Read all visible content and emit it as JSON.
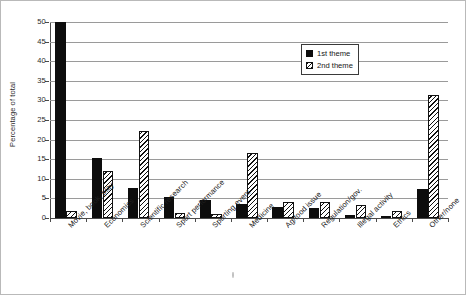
{
  "chart_data": {
    "type": "bar",
    "title": "",
    "xlabel": "",
    "ylabel": "Percentage of total",
    "ylim": [
      0,
      50
    ],
    "yticks": [
      0,
      5,
      10,
      15,
      20,
      25,
      30,
      35,
      40,
      45,
      50
    ],
    "grid": true,
    "legend_position": "top-right",
    "categories": [
      "Movie, book, play",
      "Economics",
      "Scientific research",
      "Sport performance",
      "Sporting event",
      "Medicine",
      "Ag/food issue",
      "Regulation/gov.",
      "Illegal activity",
      "Ethics",
      "Other/none"
    ],
    "series": [
      {
        "name": "1st theme",
        "fill": "solid-black",
        "values": [
          50.0,
          15.3,
          7.7,
          5.4,
          4.7,
          3.5,
          2.8,
          2.5,
          0.8,
          0.6,
          7.5
        ]
      },
      {
        "name": "2nd theme",
        "fill": "diagonal-hatch",
        "values": [
          1.8,
          12.0,
          22.1,
          1.3,
          1.0,
          16.5,
          4.0,
          4.0,
          3.3,
          1.7,
          31.5
        ]
      }
    ]
  },
  "legend": {
    "items": [
      {
        "label": "1st theme"
      },
      {
        "label": "2nd theme"
      }
    ]
  },
  "axis": {
    "y_label": "Percentage of total",
    "y_tick_labels": [
      "0",
      "5",
      "10",
      "15",
      "20",
      "25",
      "30",
      "35",
      "40",
      "45",
      "50"
    ]
  },
  "colors": {
    "series_1": "#0d0d0d",
    "series_2_outline": "#121212",
    "gridline": "#9a9a9a",
    "axis": "#4a4a4a",
    "frame": "#b9b9b9",
    "background": "#ffffff"
  }
}
